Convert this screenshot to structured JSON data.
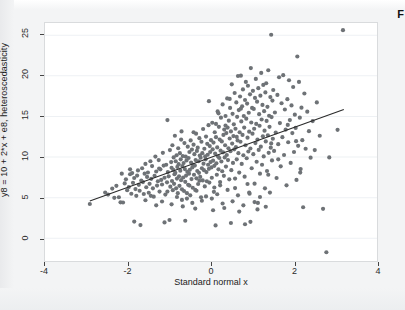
{
  "figure": {
    "caption_fragment": "F",
    "background_color": "#f3f4f5",
    "panel_color": "#ffffff",
    "point_color": "#6e7276",
    "line_color": "#2b2b2b",
    "grid_color": "#eef1f4"
  },
  "chart_data": {
    "type": "scatter",
    "title": "",
    "xlabel": "Standard normal x",
    "ylabel": "y8 = 10 + 2*x + e8, heteroscedasticity",
    "xlim": [
      -4,
      4
    ],
    "ylim": [
      -2.8,
      26.5
    ],
    "xticks": [
      -4,
      -2,
      0,
      2,
      4
    ],
    "xticklabels": [
      "-4",
      "-2",
      "0",
      "2",
      "4"
    ],
    "yticks": [
      0,
      5,
      10,
      15,
      20,
      25
    ],
    "yticklabels": [
      "0",
      "5",
      "10",
      "15",
      "20",
      "25"
    ],
    "grid": "horizontal",
    "legend": "none",
    "marker": "filled-circle",
    "marker_size": 2.1,
    "fit_line": {
      "label": "linear fit",
      "intercept": 9.95,
      "slope": 1.84,
      "x_start": -2.92,
      "x_end": 3.2,
      "y_start": 4.58,
      "y_end": 15.84
    },
    "n_points": 452,
    "points": [
      [
        -2.92,
        4.22
      ],
      [
        -2.55,
        5.62
      ],
      [
        -2.48,
        5.38
      ],
      [
        -2.38,
        6.12
      ],
      [
        -2.33,
        4.98
      ],
      [
        -2.28,
        6.45
      ],
      [
        -2.22,
        5.05
      ],
      [
        -2.18,
        4.42
      ],
      [
        -2.12,
        4.4
      ],
      [
        -2.08,
        6.75
      ],
      [
        -2.05,
        7.25
      ],
      [
        -2.02,
        5.92
      ],
      [
        -1.98,
        6.3
      ],
      [
        -1.95,
        7.88
      ],
      [
        -1.92,
        5.48
      ],
      [
        -1.9,
        8.02
      ],
      [
        -1.88,
        6.82
      ],
      [
        -1.85,
        7.42
      ],
      [
        -1.82,
        6.05
      ],
      [
        -1.8,
        5.22
      ],
      [
        -1.78,
        7.72
      ],
      [
        -1.76,
        8.35
      ],
      [
        -1.74,
        6.58
      ],
      [
        -1.72,
        5.85
      ],
      [
        -1.7,
        1.62
      ],
      [
        -1.68,
        7.1
      ],
      [
        -1.66,
        8.62
      ],
      [
        -1.64,
        6.92
      ],
      [
        -1.62,
        5.45
      ],
      [
        -1.6,
        7.95
      ],
      [
        -1.58,
        9.15
      ],
      [
        -1.56,
        6.28
      ],
      [
        -1.54,
        7.55
      ],
      [
        -1.52,
        8.1
      ],
      [
        -1.5,
        5.6
      ],
      [
        -1.48,
        6.7
      ],
      [
        -1.46,
        9.48
      ],
      [
        -1.44,
        7.32
      ],
      [
        -1.42,
        8.88
      ],
      [
        -1.4,
        6.15
      ],
      [
        -1.38,
        5.12
      ],
      [
        -1.36,
        7.68
      ],
      [
        -1.34,
        10.05
      ],
      [
        -1.32,
        8.22
      ],
      [
        -1.3,
        6.48
      ],
      [
        -1.28,
        7.02
      ],
      [
        -1.26,
        9.62
      ],
      [
        -1.24,
        5.75
      ],
      [
        -1.22,
        8.48
      ],
      [
        -1.2,
        7.18
      ],
      [
        -1.18,
        6.62
      ],
      [
        -1.16,
        10.52
      ],
      [
        -1.14,
        8.95
      ],
      [
        -1.12,
        7.45
      ],
      [
        -1.1,
        5.38
      ],
      [
        -1.08,
        9.05
      ],
      [
        -1.06,
        6.88
      ],
      [
        -1.05,
        14.55
      ],
      [
        -1.04,
        8.15
      ],
      [
        -1.02,
        7.62
      ],
      [
        -1.0,
        2.25
      ],
      [
        -0.99,
        10.85
      ],
      [
        -0.98,
        6.35
      ],
      [
        -0.96,
        9.38
      ],
      [
        -0.95,
        8.68
      ],
      [
        -0.94,
        7.05
      ],
      [
        -0.93,
        11.45
      ],
      [
        -0.92,
        5.92
      ],
      [
        -0.91,
        8.42
      ],
      [
        -0.9,
        9.95
      ],
      [
        -0.89,
        6.7
      ],
      [
        -0.88,
        7.88
      ],
      [
        -0.87,
        12.62
      ],
      [
        -0.86,
        8.05
      ],
      [
        -0.85,
        9.48
      ],
      [
        -0.84,
        6.15
      ],
      [
        -0.83,
        10.22
      ],
      [
        -0.82,
        7.35
      ],
      [
        -0.81,
        8.78
      ],
      [
        -0.8,
        5.55
      ],
      [
        -0.79,
        11.08
      ],
      [
        -0.78,
        9.12
      ],
      [
        -0.77,
        7.62
      ],
      [
        -0.76,
        6.45
      ],
      [
        -0.75,
        10.48
      ],
      [
        -0.74,
        8.32
      ],
      [
        -0.73,
        9.72
      ],
      [
        -0.72,
        7.15
      ],
      [
        -0.71,
        13.15
      ],
      [
        -0.7,
        6.02
      ],
      [
        -0.69,
        8.88
      ],
      [
        -0.68,
        10.12
      ],
      [
        -0.67,
        7.48
      ],
      [
        -0.66,
        9.25
      ],
      [
        -0.65,
        5.82
      ],
      [
        -0.64,
        11.72
      ],
      [
        -0.63,
        8.52
      ],
      [
        -0.62,
        6.95
      ],
      [
        -0.61,
        10.05
      ],
      [
        -0.6,
        7.72
      ],
      [
        -0.59,
        9.58
      ],
      [
        -0.58,
        4.88
      ],
      [
        -0.57,
        8.18
      ],
      [
        -0.56,
        11.28
      ],
      [
        -0.55,
        6.58
      ],
      [
        -0.54,
        9.88
      ],
      [
        -0.53,
        7.95
      ],
      [
        -0.52,
        10.62
      ],
      [
        -0.51,
        8.42
      ],
      [
        -0.5,
        5.28
      ],
      [
        -0.49,
        12.05
      ],
      [
        -0.48,
        9.32
      ],
      [
        -0.47,
        7.28
      ],
      [
        -0.46,
        10.92
      ],
      [
        -0.45,
        8.72
      ],
      [
        -0.44,
        6.22
      ],
      [
        -0.43,
        9.05
      ],
      [
        -0.42,
        11.52
      ],
      [
        -0.41,
        7.82
      ],
      [
        -0.4,
        10.35
      ],
      [
        -0.39,
        8.95
      ],
      [
        -0.38,
        5.95
      ],
      [
        -0.37,
        9.62
      ],
      [
        -0.36,
        12.88
      ],
      [
        -0.35,
        7.38
      ],
      [
        -0.34,
        10.75
      ],
      [
        -0.33,
        8.28
      ],
      [
        -0.32,
        11.15
      ],
      [
        -0.31,
        6.68
      ],
      [
        -0.3,
        9.48
      ],
      [
        -0.29,
        8.05
      ],
      [
        -0.28,
        12.32
      ],
      [
        -0.27,
        10.18
      ],
      [
        -0.26,
        7.55
      ],
      [
        -0.25,
        9.92
      ],
      [
        -0.24,
        5.05
      ],
      [
        -0.23,
        11.88
      ],
      [
        -0.22,
        8.62
      ],
      [
        -0.21,
        10.48
      ],
      [
        -0.2,
        7.12
      ],
      [
        -0.19,
        13.45
      ],
      [
        -0.18,
        9.18
      ],
      [
        -0.17,
        8.38
      ],
      [
        -0.16,
        11.02
      ],
      [
        -0.15,
        6.38
      ],
      [
        -0.14,
        10.08
      ],
      [
        -0.13,
        9.72
      ],
      [
        -0.12,
        12.52
      ],
      [
        -0.11,
        8.15
      ],
      [
        -0.1,
        7.02
      ],
      [
        -0.09,
        11.62
      ],
      [
        -0.08,
        10.28
      ],
      [
        -0.07,
        9.05
      ],
      [
        -0.06,
        13.92
      ],
      [
        -0.05,
        8.55
      ],
      [
        -0.04,
        6.85
      ],
      [
        -0.03,
        11.35
      ],
      [
        -0.02,
        10.62
      ],
      [
        -0.01,
        9.38
      ],
      [
        0.0,
        12.08
      ],
      [
        0.01,
        8.72
      ],
      [
        0.02,
        7.45
      ],
      [
        0.03,
        14.22
      ],
      [
        0.04,
        10.95
      ],
      [
        0.05,
        9.55
      ],
      [
        0.06,
        11.78
      ],
      [
        0.07,
        5.72
      ],
      [
        0.08,
        8.92
      ],
      [
        0.09,
        13.05
      ],
      [
        0.1,
        10.42
      ],
      [
        0.11,
        1.58
      ],
      [
        0.12,
        12.45
      ],
      [
        0.13,
        9.22
      ],
      [
        0.14,
        7.82
      ],
      [
        0.15,
        11.18
      ],
      [
        0.16,
        15.62
      ],
      [
        0.17,
        10.05
      ],
      [
        0.18,
        8.48
      ],
      [
        0.19,
        13.72
      ],
      [
        0.2,
        9.88
      ],
      [
        0.21,
        12.15
      ],
      [
        0.22,
        6.52
      ],
      [
        0.23,
        10.78
      ],
      [
        0.24,
        14.85
      ],
      [
        0.25,
        9.45
      ],
      [
        0.26,
        11.92
      ],
      [
        0.27,
        8.25
      ],
      [
        0.28,
        16.48
      ],
      [
        0.29,
        10.58
      ],
      [
        0.3,
        12.72
      ],
      [
        0.31,
        7.68
      ],
      [
        0.32,
        13.38
      ],
      [
        0.33,
        9.95
      ],
      [
        0.34,
        11.45
      ],
      [
        0.35,
        15.05
      ],
      [
        0.36,
        8.82
      ],
      [
        0.37,
        12.95
      ],
      [
        0.38,
        10.25
      ],
      [
        0.39,
        17.22
      ],
      [
        0.4,
        13.62
      ],
      [
        0.41,
        9.62
      ],
      [
        0.42,
        11.08
      ],
      [
        0.43,
        14.48
      ],
      [
        0.44,
        7.25
      ],
      [
        0.45,
        12.28
      ],
      [
        0.46,
        16.05
      ],
      [
        0.47,
        10.72
      ],
      [
        0.48,
        13.15
      ],
      [
        0.49,
        8.38
      ],
      [
        0.5,
        18.95
      ],
      [
        0.51,
        11.65
      ],
      [
        0.52,
        15.32
      ],
      [
        0.53,
        9.28
      ],
      [
        0.54,
        12.58
      ],
      [
        0.55,
        14.02
      ],
      [
        0.56,
        10.95
      ],
      [
        0.57,
        17.88
      ],
      [
        0.58,
        6.18
      ],
      [
        0.59,
        13.48
      ],
      [
        0.6,
        11.22
      ],
      [
        0.61,
        16.72
      ],
      [
        0.62,
        9.72
      ],
      [
        0.63,
        14.95
      ],
      [
        0.64,
        12.05
      ],
      [
        0.65,
        19.98
      ],
      [
        0.66,
        10.48
      ],
      [
        0.67,
        15.78
      ],
      [
        0.68,
        8.08
      ],
      [
        0.69,
        13.05
      ],
      [
        0.7,
        17.45
      ],
      [
        0.71,
        11.88
      ],
      [
        0.72,
        20.02
      ],
      [
        0.73,
        14.38
      ],
      [
        0.74,
        9.15
      ],
      [
        0.75,
        16.25
      ],
      [
        0.76,
        12.72
      ],
      [
        0.77,
        18.32
      ],
      [
        0.78,
        10.22
      ],
      [
        0.79,
        15.05
      ],
      [
        0.8,
        13.62
      ],
      [
        0.81,
        7.58
      ],
      [
        0.82,
        17.02
      ],
      [
        0.83,
        11.45
      ],
      [
        0.84,
        19.25
      ],
      [
        0.85,
        14.72
      ],
      [
        0.86,
        9.85
      ],
      [
        0.87,
        16.58
      ],
      [
        0.88,
        12.38
      ],
      [
        0.89,
        18.78
      ],
      [
        0.9,
        10.68
      ],
      [
        0.91,
        15.45
      ],
      [
        0.92,
        13.12
      ],
      [
        0.93,
        5.48
      ],
      [
        0.94,
        17.72
      ],
      [
        0.95,
        11.05
      ],
      [
        0.96,
        20.95
      ],
      [
        0.97,
        14.25
      ],
      [
        0.98,
        8.62
      ],
      [
        0.99,
        16.05
      ],
      [
        1.0,
        12.88
      ],
      [
        1.01,
        18.15
      ],
      [
        1.02,
        10.35
      ],
      [
        1.03,
        15.92
      ],
      [
        1.04,
        13.48
      ],
      [
        1.05,
        6.72
      ],
      [
        1.06,
        17.28
      ],
      [
        1.07,
        11.72
      ],
      [
        1.08,
        19.62
      ],
      [
        1.09,
        14.08
      ],
      [
        1.1,
        9.42
      ],
      [
        1.11,
        16.82
      ],
      [
        1.12,
        12.15
      ],
      [
        1.13,
        4.35
      ],
      [
        1.14,
        18.48
      ],
      [
        1.15,
        10.88
      ],
      [
        1.16,
        15.28
      ],
      [
        1.17,
        13.85
      ],
      [
        1.18,
        7.95
      ],
      [
        1.19,
        17.55
      ],
      [
        1.2,
        11.28
      ],
      [
        1.21,
        20.35
      ],
      [
        1.22,
        14.62
      ],
      [
        1.23,
        9.05
      ],
      [
        1.24,
        16.42
      ],
      [
        1.25,
        12.55
      ],
      [
        1.26,
        18.88
      ],
      [
        1.27,
        10.08
      ],
      [
        1.28,
        15.65
      ],
      [
        1.29,
        13.25
      ],
      [
        1.3,
        6.15
      ],
      [
        1.31,
        17.95
      ],
      [
        1.32,
        11.92
      ],
      [
        1.33,
        19.08
      ],
      [
        1.34,
        14.45
      ],
      [
        1.35,
        8.28
      ],
      [
        1.36,
        16.18
      ],
      [
        1.37,
        12.68
      ],
      [
        1.38,
        20.68
      ],
      [
        1.39,
        10.52
      ],
      [
        1.4,
        15.08
      ],
      [
        1.41,
        13.72
      ],
      [
        1.42,
        5.62
      ],
      [
        1.43,
        17.38
      ],
      [
        1.44,
        11.15
      ],
      [
        1.45,
        25.05
      ],
      [
        1.46,
        14.92
      ],
      [
        1.47,
        9.58
      ],
      [
        1.48,
        16.95
      ],
      [
        1.49,
        12.25
      ],
      [
        1.5,
        18.25
      ],
      [
        1.52,
        10.75
      ],
      [
        1.54,
        15.48
      ],
      [
        1.56,
        13.02
      ],
      [
        1.58,
        7.42
      ],
      [
        1.6,
        17.65
      ],
      [
        1.62,
        11.58
      ],
      [
        1.64,
        19.82
      ],
      [
        1.66,
        14.18
      ],
      [
        1.68,
        8.85
      ],
      [
        1.7,
        16.62
      ],
      [
        1.72,
        12.45
      ],
      [
        1.74,
        20.08
      ],
      [
        1.76,
        10.25
      ],
      [
        1.78,
        15.85
      ],
      [
        1.8,
        13.38
      ],
      [
        1.82,
        6.52
      ],
      [
        1.84,
        17.12
      ],
      [
        1.86,
        11.82
      ],
      [
        1.88,
        19.45
      ],
      [
        1.9,
        14.55
      ],
      [
        1.92,
        9.28
      ],
      [
        1.94,
        16.35
      ],
      [
        1.96,
        12.95
      ],
      [
        1.98,
        18.62
      ],
      [
        2.0,
        10.62
      ],
      [
        2.02,
        15.22
      ],
      [
        2.04,
        13.58
      ],
      [
        2.06,
        7.18
      ],
      [
        2.08,
        22.38
      ],
      [
        2.1,
        11.38
      ],
      [
        2.12,
        19.25
      ],
      [
        2.14,
        14.85
      ],
      [
        2.16,
        8.52
      ],
      [
        2.18,
        16.08
      ],
      [
        2.2,
        12.08
      ],
      [
        2.22,
        3.82
      ],
      [
        2.25,
        17.82
      ],
      [
        2.28,
        11.02
      ],
      [
        2.32,
        15.58
      ],
      [
        2.36,
        13.18
      ],
      [
        2.4,
        9.92
      ],
      [
        2.45,
        14.42
      ],
      [
        2.5,
        10.85
      ],
      [
        2.55,
        16.72
      ],
      [
        2.62,
        12.62
      ],
      [
        2.7,
        3.62
      ],
      [
        2.78,
        -1.72
      ],
      [
        2.85,
        9.95
      ],
      [
        3.05,
        13.35
      ],
      [
        3.18,
        25.62
      ],
      [
        -1.58,
        4.68
      ],
      [
        -1.45,
        5.22
      ],
      [
        -1.32,
        4.05
      ],
      [
        -1.18,
        4.52
      ],
      [
        -1.05,
        5.75
      ],
      [
        -0.95,
        4.18
      ],
      [
        -0.82,
        5.08
      ],
      [
        -0.7,
        4.72
      ],
      [
        -0.58,
        5.55
      ],
      [
        -0.45,
        4.35
      ],
      [
        -0.35,
        5.85
      ],
      [
        -0.22,
        4.62
      ],
      [
        -0.12,
        5.15
      ],
      [
        0.02,
        4.88
      ],
      [
        0.15,
        5.42
      ],
      [
        0.28,
        4.28
      ],
      [
        0.4,
        5.95
      ],
      [
        0.52,
        4.55
      ],
      [
        0.65,
        5.28
      ],
      [
        0.78,
        4.05
      ],
      [
        0.92,
        5.62
      ],
      [
        1.05,
        4.45
      ],
      [
        1.18,
        5.08
      ],
      [
        1.32,
        3.88
      ],
      [
        -1.85,
        2.05
      ],
      [
        -1.12,
        1.95
      ],
      [
        -0.62,
        2.15
      ],
      [
        0.48,
        1.88
      ],
      [
        0.82,
        1.72
      ],
      [
        0.95,
        2.02
      ],
      [
        -0.52,
        6.48
      ],
      [
        -0.28,
        7.08
      ],
      [
        0.08,
        6.25
      ],
      [
        0.22,
        6.92
      ],
      [
        0.58,
        7.35
      ],
      [
        0.88,
        6.68
      ],
      [
        -1.25,
        8.58
      ],
      [
        -0.72,
        12.15
      ],
      [
        -0.42,
        13.05
      ],
      [
        0.12,
        14.08
      ],
      [
        0.35,
        13.88
      ],
      [
        0.62,
        12.48
      ],
      [
        -2.15,
        7.95
      ],
      [
        -1.95,
        8.48
      ],
      [
        -0.05,
        16.88
      ],
      [
        0.18,
        15.38
      ],
      [
        0.45,
        17.15
      ],
      [
        0.72,
        15.95
      ],
      [
        1.45,
        11.68
      ],
      [
        1.62,
        9.72
      ],
      [
        1.85,
        13.95
      ],
      [
        2.05,
        11.95
      ],
      [
        2.15,
        8.08
      ],
      [
        1.38,
        7.82
      ],
      [
        -0.68,
        3.92
      ],
      [
        -0.38,
        3.65
      ],
      [
        0.05,
        3.45
      ],
      [
        0.32,
        3.72
      ],
      [
        0.68,
        3.28
      ],
      [
        1.12,
        3.55
      ]
    ]
  }
}
